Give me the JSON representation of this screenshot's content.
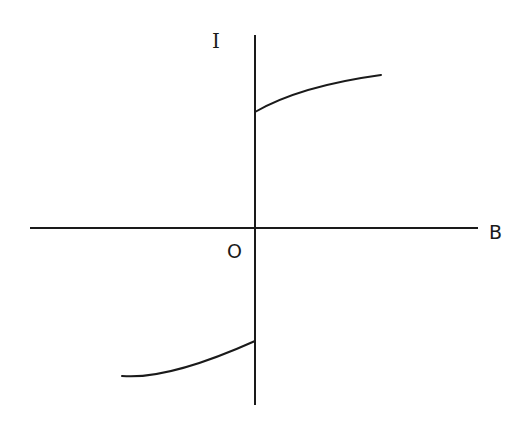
{
  "diagram": {
    "title": "",
    "labels": {
      "y_axis": "I",
      "x_axis": "B",
      "origin": "O"
    },
    "colors": {
      "ink": "#1a1a1a",
      "background": "#ffffff"
    },
    "axes": {
      "x_axis": {
        "x1": 30,
        "y": 228,
        "x2": 478
      },
      "y_axis": {
        "x": 255,
        "y1": 35,
        "y2": 405
      }
    },
    "curves": [
      {
        "name": "upper-branch",
        "description": "Starts at positive I-intercept on the I axis and rises concavely toward saturation as B increases",
        "start": [
          255,
          112
        ],
        "end": [
          381,
          75
        ]
      },
      {
        "name": "lower-branch",
        "description": "Mirror branch for negative B: starts at far left and rises to the negative I-intercept on the I axis",
        "start": [
          122,
          376
        ],
        "end": [
          255,
          341
        ]
      }
    ]
  }
}
